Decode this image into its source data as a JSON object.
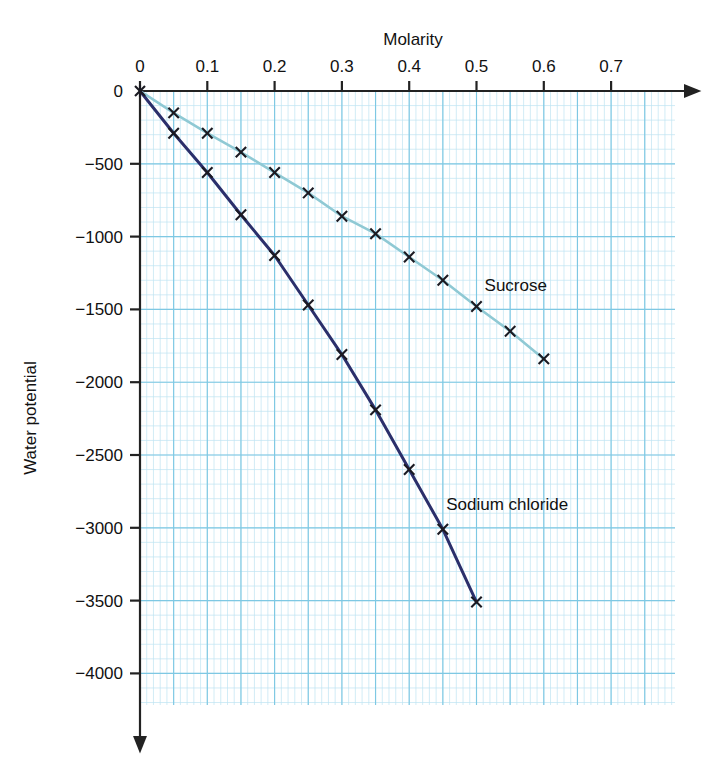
{
  "chart_data": {
    "type": "line",
    "title": "",
    "xlabel": "Molarity",
    "ylabel": "Water potential",
    "x_ticks": [
      "0",
      "0.1",
      "0.2",
      "0.3",
      "0.4",
      "0.5",
      "0.6",
      "0.7"
    ],
    "x_tick_values": [
      0,
      0.1,
      0.2,
      0.3,
      0.4,
      0.5,
      0.6,
      0.7
    ],
    "y_ticks": [
      "0",
      "−500",
      "−1000",
      "−1500",
      "−2000",
      "−2500",
      "−3000",
      "−3500",
      "−4000"
    ],
    "y_tick_values": [
      0,
      -500,
      -1000,
      -1500,
      -2000,
      -2500,
      -3000,
      -3500,
      -4000
    ],
    "xlim": [
      0,
      0.74
    ],
    "ylim": [
      -4200,
      0
    ],
    "grid": true,
    "grid_major_color": "#7ec8e3",
    "grid_minor_color": "#bfe4f2",
    "legend_position": "inline-annotation",
    "marker": "x",
    "series": [
      {
        "name": "Sucrose",
        "color": "#8fc9d4",
        "label_x": 0.512,
        "label_y": -1335,
        "x": [
          0,
          0.05,
          0.1,
          0.15,
          0.2,
          0.25,
          0.3,
          0.35,
          0.4,
          0.45,
          0.5,
          0.55,
          0.6
        ],
        "values": [
          0,
          -150,
          -290,
          -420,
          -560,
          -700,
          -860,
          -980,
          -1140,
          -1300,
          -1480,
          -1650,
          -1840
        ]
      },
      {
        "name": "Sodium chloride",
        "color": "#2b2f6b",
        "label_x": 0.455,
        "label_y": -2835,
        "x": [
          0,
          0.05,
          0.1,
          0.15,
          0.2,
          0.25,
          0.3,
          0.35,
          0.4,
          0.45,
          0.5
        ],
        "values": [
          0,
          -290,
          -560,
          -850,
          -1130,
          -1470,
          -1810,
          -2190,
          -2600,
          -3010,
          -3510
        ]
      }
    ]
  }
}
